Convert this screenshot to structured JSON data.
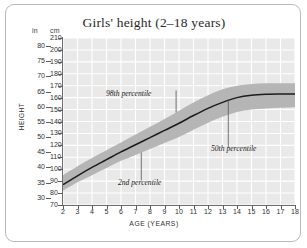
{
  "chart_data": {
    "type": "area",
    "title": "Girls' height (2–18 years)",
    "xlabel": "AGE (YEARS)",
    "ylabel": "HEIGHT",
    "grid": true,
    "legend": "none",
    "x": [
      2,
      3,
      4,
      5,
      6,
      7,
      8,
      9,
      10,
      11,
      12,
      13,
      14,
      15,
      16,
      17,
      18
    ],
    "xlim": [
      2,
      18
    ],
    "x_ticks": [
      "2",
      "3",
      "4",
      "5",
      "6",
      "7",
      "8",
      "9",
      "10",
      "11",
      "12",
      "13",
      "14",
      "15",
      "16",
      "17",
      "18"
    ],
    "y_unit_primary": "cm",
    "y_unit_secondary": "in",
    "ylim_cm": [
      70,
      210
    ],
    "y_ticks_cm": [
      "210",
      "200",
      "190",
      "180",
      "170",
      "160",
      "150",
      "140",
      "130",
      "120",
      "110",
      "100",
      "90",
      "80",
      "70"
    ],
    "y_ticks_in": [
      "80",
      "75",
      "70",
      "65",
      "60",
      "55",
      "50",
      "45",
      "40",
      "35",
      "30"
    ],
    "y_ticks_in_values_cm": [
      203.2,
      190.5,
      177.8,
      165.1,
      152.4,
      139.7,
      127.0,
      114.3,
      101.6,
      88.9,
      76.2
    ],
    "series": [
      {
        "name": "2nd percentile",
        "values": [
          82,
          89,
          95,
          101,
          107,
          112,
          117,
          122,
          127,
          133,
          139,
          144,
          148,
          150,
          151,
          151.5,
          152
        ]
      },
      {
        "name": "50th percentile",
        "values": [
          87,
          94.5,
          101.5,
          108,
          114.5,
          120.5,
          126.5,
          132.5,
          138.5,
          145,
          151,
          156,
          160,
          162,
          162.8,
          163,
          163
        ]
      },
      {
        "name": "98th percentile",
        "values": [
          95,
          102.5,
          109.5,
          116,
          122.5,
          129,
          135.5,
          142,
          149,
          156,
          162,
          167,
          170,
          171.5,
          172,
          172,
          172
        ]
      }
    ],
    "annotations": [
      {
        "label": "98th percentile",
        "points_to_series": "98th percentile",
        "at_age": 9.8
      },
      {
        "label": "2nd percentile",
        "points_to_series": "2nd percentile",
        "at_age": 7.4
      },
      {
        "label": "50th percentile",
        "points_to_series": "50th percentile",
        "at_age": 13.4
      }
    ],
    "colors": {
      "band": "#b2b2b2",
      "band_inner": "#9d9d9d",
      "median_line": "#1c1c1c",
      "plot_background": "#e9e9e9",
      "gridline": "#ffffff",
      "axis": "#6e6e6e",
      "frame": "#b9b9b9",
      "text": "#2a2a2a"
    }
  }
}
